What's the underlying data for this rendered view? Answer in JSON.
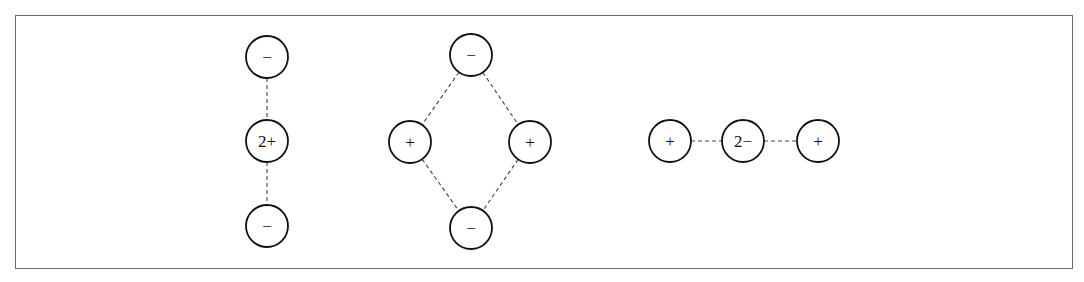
{
  "diagram": {
    "type": "ion-arrangements",
    "stroke_color": "#111111",
    "bond_style": "dashed",
    "groups": [
      {
        "name": "linear-vertical",
        "nodes": [
          {
            "id": "a1",
            "label": "−",
            "x": 267,
            "y": 57
          },
          {
            "id": "a2",
            "label": "2+",
            "x": 267,
            "y": 141
          },
          {
            "id": "a3",
            "label": "−",
            "x": 267,
            "y": 226
          }
        ],
        "edges": [
          [
            "a1",
            "a2"
          ],
          [
            "a2",
            "a3"
          ]
        ]
      },
      {
        "name": "rhombus",
        "nodes": [
          {
            "id": "b1",
            "label": "−",
            "x": 471,
            "y": 55
          },
          {
            "id": "b2",
            "label": "+",
            "x": 410,
            "y": 142
          },
          {
            "id": "b3",
            "label": "+",
            "x": 530,
            "y": 142
          },
          {
            "id": "b4",
            "label": "−",
            "x": 471,
            "y": 228
          }
        ],
        "edges": [
          [
            "b1",
            "b2"
          ],
          [
            "b1",
            "b3"
          ],
          [
            "b2",
            "b4"
          ],
          [
            "b3",
            "b4"
          ]
        ]
      },
      {
        "name": "linear-horizontal",
        "nodes": [
          {
            "id": "c1",
            "label": "+",
            "x": 670,
            "y": 141
          },
          {
            "id": "c2",
            "label": "2−",
            "x": 743,
            "y": 141
          },
          {
            "id": "c3",
            "label": "+",
            "x": 818,
            "y": 141
          }
        ],
        "edges": [
          [
            "c1",
            "c2"
          ],
          [
            "c2",
            "c3"
          ]
        ]
      }
    ]
  }
}
